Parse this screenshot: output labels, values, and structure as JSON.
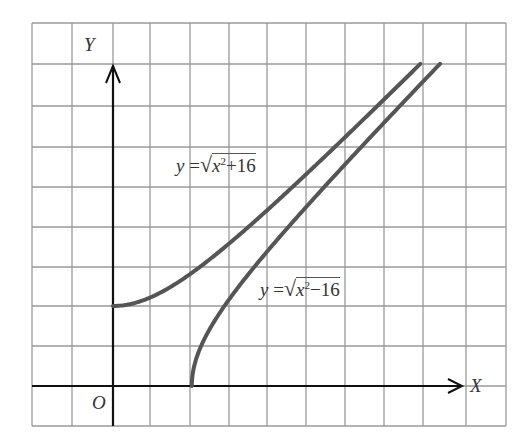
{
  "chart_data": {
    "type": "line",
    "title": "",
    "xlabel": "X",
    "ylabel": "Y",
    "origin_label": "O",
    "grid": true,
    "grid_unit": 2,
    "xlim": [
      -4,
      20
    ],
    "ylim": [
      -2,
      18
    ],
    "series": [
      {
        "name": "y = √(x²+16)",
        "label_parts": {
          "lhs": "y",
          "eq": "=",
          "rad": "x",
          "sup": "2",
          "op": "+",
          "num": "16"
        },
        "formula": "sqrt(x^2+16)",
        "domain": [
          0,
          15.6
        ],
        "color": "#555555",
        "points": [
          [
            0,
            4
          ],
          [
            2,
            4.47
          ],
          [
            4,
            5.66
          ],
          [
            6,
            7.21
          ],
          [
            8,
            8.94
          ],
          [
            10,
            10.77
          ],
          [
            12,
            12.65
          ],
          [
            14,
            14.56
          ],
          [
            15.6,
            16.1
          ]
        ]
      },
      {
        "name": "y = √(x²−16)",
        "label_parts": {
          "lhs": "y",
          "eq": "=",
          "rad": "x",
          "sup": "2",
          "op": "−",
          "num": "16"
        },
        "formula": "sqrt(x^2-16)",
        "domain": [
          4,
          16.6
        ],
        "color": "#555555",
        "points": [
          [
            4,
            0
          ],
          [
            5,
            3
          ],
          [
            6,
            4.47
          ],
          [
            8,
            6.93
          ],
          [
            10,
            9.17
          ],
          [
            12,
            11.31
          ],
          [
            14,
            13.42
          ],
          [
            16.6,
            16.1
          ]
        ]
      }
    ]
  },
  "colors": {
    "grid": "#9a9a9a",
    "axis": "#111111",
    "curve": "#555555"
  }
}
